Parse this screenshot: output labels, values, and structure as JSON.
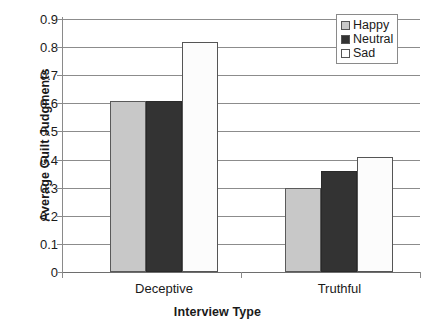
{
  "chart_data": {
    "type": "bar",
    "title": "",
    "subtitle": "",
    "xlabel": "Interview Type",
    "ylabel": "Average Guilt Judgments",
    "categories": [
      "Deceptive",
      "Truthful"
    ],
    "series": [
      {
        "name": "Happy",
        "values": [
          0.61,
          0.3
        ],
        "color": "#c8c8c8"
      },
      {
        "name": "Neutral",
        "values": [
          0.61,
          0.36
        ],
        "color": "#333333"
      },
      {
        "name": "Sad",
        "values": [
          0.82,
          0.41
        ],
        "color": "#ffffff"
      }
    ],
    "ylim": [
      0,
      0.9
    ],
    "ytick_step": 0.1,
    "ytick_labels": [
      "0.9",
      "0.8",
      "0.7",
      "0.6",
      "0.5",
      "0.4",
      "0.3",
      "0.2",
      "0.1",
      "0"
    ],
    "ytick_values": [
      0.9,
      0.8,
      0.7,
      0.6,
      0.5,
      0.4,
      0.3,
      0.2,
      0.1,
      0
    ],
    "grid": "horizontal",
    "grid_color": "#8c8c8c",
    "legend_position": "top-right",
    "legend_border": true,
    "bar_border_color": "#555555",
    "background": "#ffffff"
  }
}
